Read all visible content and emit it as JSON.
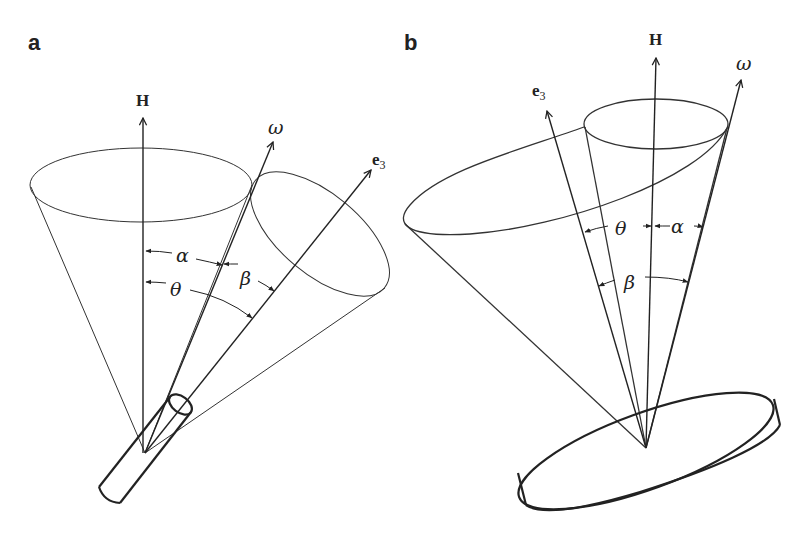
{
  "figure": {
    "panels": [
      {
        "label": "a",
        "description": "Prolate rigid body (rod) torque-free precession",
        "vectors": {
          "H": "H",
          "omega": "ω",
          "e3_base": "e",
          "e3_sub": "3"
        },
        "angles": {
          "alpha": "α",
          "beta": "β",
          "theta": "θ"
        }
      },
      {
        "label": "b",
        "description": "Oblate rigid body (disc) torque-free precession",
        "vectors": {
          "H": "H",
          "omega": "ω",
          "e3_base": "e",
          "e3_sub": "3"
        },
        "angles": {
          "alpha": "α",
          "beta": "β",
          "theta": "θ"
        }
      }
    ],
    "colors": {
      "line": "#222222",
      "background": "#ffffff"
    }
  }
}
